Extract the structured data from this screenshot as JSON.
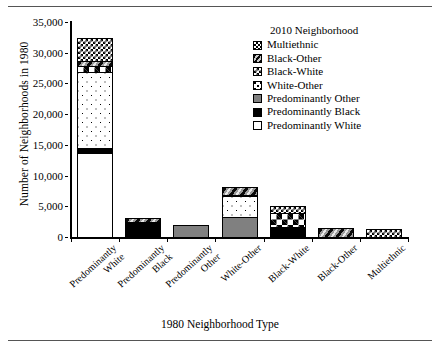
{
  "chart_data": {
    "type": "bar",
    "subtype": "stacked-bar",
    "title": "",
    "xlabel": "1980 Neighborhood Type",
    "ylabel": "Number of Neighborhoods in 1980",
    "ylim": [
      0,
      35000
    ],
    "ytick_values": [
      0,
      5000,
      10000,
      15000,
      20000,
      25000,
      30000,
      35000
    ],
    "ytick_labels": [
      "0",
      "5,000",
      "10,000",
      "15,000",
      "20,000",
      "25,000",
      "30,000",
      "35,000"
    ],
    "grid": false,
    "legend_position": "top-right",
    "legend_title": "2010 Neighborhood",
    "categories": [
      "Predominantly White",
      "Predominantly Black",
      "Predominantly Other",
      "White-Other",
      "Black-White",
      "Black-Other",
      "Multiethnic"
    ],
    "category_lines": [
      [
        "Predominantly",
        "White"
      ],
      [
        "Predominantly",
        "Black"
      ],
      [
        "Predominantly",
        "Other"
      ],
      [
        "White-Other"
      ],
      [
        "Black-White"
      ],
      [
        "Black-Other"
      ],
      [
        "Multiethnic"
      ]
    ],
    "series": [
      {
        "name": "Predominantly White",
        "pattern": "solid-white",
        "values": [
          13800,
          0,
          0,
          0,
          0,
          0,
          0
        ]
      },
      {
        "name": "Predominantly Black",
        "pattern": "solid-black",
        "values": [
          850,
          2600,
          0,
          0,
          1800,
          0,
          0
        ]
      },
      {
        "name": "Predominantly Other",
        "pattern": "solid-gray",
        "values": [
          0,
          0,
          2100,
          3400,
          0,
          0,
          0
        ]
      },
      {
        "name": "White-Other",
        "pattern": "dots",
        "values": [
          12550,
          0,
          0,
          3600,
          0,
          0,
          0
        ]
      },
      {
        "name": "Black-White",
        "pattern": "checker-large",
        "values": [
          1100,
          0,
          0,
          0,
          2300,
          0,
          0
        ]
      },
      {
        "name": "Black-Other",
        "pattern": "diagonal-stripes",
        "values": [
          1000,
          800,
          0,
          1600,
          0,
          1650,
          0
        ]
      },
      {
        "name": "Multiethnic",
        "pattern": "checker-small",
        "values": [
          3900,
          0,
          0,
          0,
          1300,
          0,
          1500
        ]
      }
    ],
    "totals": [
      33200,
      3400,
      2100,
      8600,
      5400,
      1650,
      1500
    ],
    "legend_entries": [
      {
        "label": "Multiethnic",
        "pattern": "checker-small"
      },
      {
        "label": "Black-Other",
        "pattern": "diagonal-stripes"
      },
      {
        "label": "Black-White",
        "pattern": "checker-large"
      },
      {
        "label": "White-Other",
        "pattern": "dots"
      },
      {
        "label": "Predominantly Other",
        "pattern": "solid-gray"
      },
      {
        "label": "Predominantly Black",
        "pattern": "solid-black"
      },
      {
        "label": "Predominantly White",
        "pattern": "solid-white"
      }
    ],
    "colors": {
      "axis": "#000000",
      "solid_white": "#ffffff",
      "solid_black": "#000000",
      "solid_gray": "#808080",
      "rule": "#555555"
    }
  }
}
